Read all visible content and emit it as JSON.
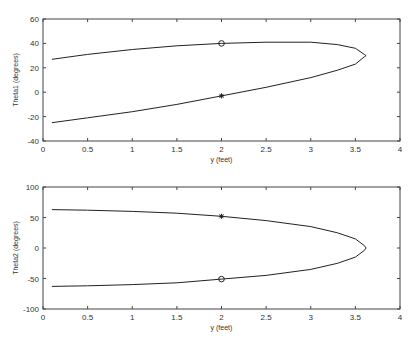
{
  "chart_data": [
    {
      "type": "line",
      "title": "",
      "xlabel": "y (feet)",
      "ylabel": "Theta1 (degrees)",
      "xlim": [
        0,
        4
      ],
      "ylim": [
        -40,
        60
      ],
      "xticks": [
        "0",
        "0.5",
        "1",
        "1.5",
        "2",
        "2.5",
        "3",
        "3.5",
        "4"
      ],
      "yticks": [
        "60",
        "40",
        "20",
        "0",
        "-20",
        "-40"
      ],
      "grid": false,
      "series": [
        {
          "name": "upper branch",
          "x": [
            0.1,
            0.5,
            1.0,
            1.5,
            2.0,
            2.5,
            3.0,
            3.3,
            3.5,
            3.6
          ],
          "values": [
            27,
            31,
            35,
            38,
            40,
            41,
            41,
            39,
            36,
            31
          ]
        },
        {
          "name": "lower branch",
          "x": [
            0.1,
            0.5,
            1.0,
            1.5,
            2.0,
            2.5,
            3.0,
            3.3,
            3.5,
            3.6
          ],
          "values": [
            -25,
            -21,
            -16,
            -10,
            -3,
            4,
            12,
            18,
            23,
            29
          ]
        }
      ],
      "markers": [
        {
          "shape": "circle",
          "x": 2,
          "y": 40
        },
        {
          "shape": "star",
          "x": 2,
          "y": -3
        }
      ]
    },
    {
      "type": "line",
      "title": "",
      "xlabel": "y (feet)",
      "ylabel": "Theta2 (degrees)",
      "xlim": [
        0,
        4
      ],
      "ylim": [
        -100,
        100
      ],
      "xticks": [
        "0",
        "0.5",
        "1",
        "1.5",
        "2",
        "2.5",
        "3",
        "3.5",
        "4"
      ],
      "yticks": [
        "100",
        "50",
        "0",
        "-50",
        "-100"
      ],
      "grid": false,
      "series": [
        {
          "name": "upper branch",
          "x": [
            0.1,
            0.5,
            1.0,
            1.5,
            2.0,
            2.5,
            3.0,
            3.3,
            3.5,
            3.6
          ],
          "values": [
            63,
            62,
            60,
            57,
            52,
            45,
            35,
            25,
            15,
            4
          ]
        },
        {
          "name": "lower branch",
          "x": [
            0.1,
            0.5,
            1.0,
            1.5,
            2.0,
            2.5,
            3.0,
            3.3,
            3.5,
            3.6
          ],
          "values": [
            -63,
            -62,
            -60,
            -57,
            -51,
            -45,
            -35,
            -25,
            -15,
            -4
          ]
        }
      ],
      "markers": [
        {
          "shape": "star",
          "x": 2,
          "y": 52
        },
        {
          "shape": "circle",
          "x": 2,
          "y": -51
        }
      ]
    }
  ]
}
